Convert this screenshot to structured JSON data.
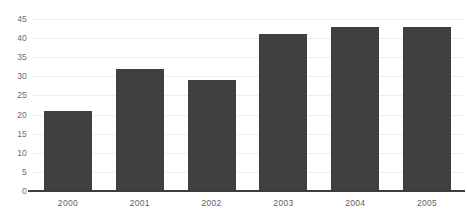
{
  "chart_data": {
    "type": "bar",
    "title": "",
    "xlabel": "",
    "ylabel": "",
    "categories": [
      "2000",
      "2001",
      "2002",
      "2003",
      "2004",
      "2005"
    ],
    "values": [
      21,
      32,
      29,
      41,
      43,
      43
    ],
    "series": [
      {
        "name": "Value",
        "values": [
          21,
          32,
          29,
          41,
          43,
          43
        ]
      }
    ],
    "ylim": [
      0,
      45
    ],
    "ytick_labels": [
      "0",
      "5",
      "10",
      "15",
      "20",
      "25",
      "30",
      "35",
      "40",
      "45"
    ],
    "ytick_values": [
      0,
      5,
      10,
      15,
      20,
      25,
      30,
      35,
      40,
      45
    ],
    "grid": true,
    "legend": false,
    "legend_position": "none",
    "bar_color": "#404040",
    "gridline_color": "#ededed",
    "axis_color": "#3d3d3d",
    "background_color": "#ffffff"
  }
}
